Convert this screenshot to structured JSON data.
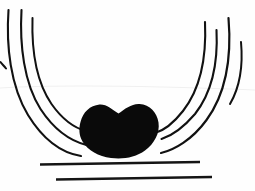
{
  "figure": {
    "canvas": {
      "width": 255,
      "height": 191,
      "background_color": "#fefefe"
    },
    "ink_color": "#111111",
    "mass_color": "#0a0a0a",
    "artifact_color": "#f0f0f0"
  },
  "left_fan": {
    "name": "left-arc-bundle",
    "count": 4,
    "strokes": [
      {
        "id": "left-arc-1",
        "label": "outer left arc",
        "width": 2.1,
        "d": "M 8.5 10 C 6.0 46 10.5 86 28.0 115 C 44.0 141 62.0 153 81.0 156"
      },
      {
        "id": "left-arc-2",
        "label": "second left arc",
        "width": 2.1,
        "d": "M 21.5 10 C 19.5 45 24.0 83 40.5 109 C 55.0 131 70.5 141 86.5 145"
      },
      {
        "id": "left-arc-3",
        "label": "third left arc",
        "width": 2.0,
        "d": "M 32.5 18 C 31.5 50 36.5 82 51.5 104 C 63.5 121 74.5 128 86.0 131"
      },
      {
        "id": "left-arc-4",
        "label": "short left edge tick",
        "width": 2.0,
        "d": "M 0.5 62 C 2.0 64 4.0 66 6.0 68.5"
      }
    ]
  },
  "right_fan": {
    "name": "right-arc-bundle",
    "count": 4,
    "strokes": [
      {
        "id": "right-arc-1",
        "label": "inner right arc",
        "width": 2.1,
        "d": "M 205.0 22 C 206.5 55 201.0 88 183.0 111 C 172.0 125 162.0 131 155.0 133"
      },
      {
        "id": "right-arc-2",
        "label": "second right arc",
        "width": 2.1,
        "d": "M 216.5 30 C 218.0 60 213.0 91 195.0 114 C 183.0 128 171.0 136 161.5 139"
      },
      {
        "id": "right-arc-3",
        "label": "outer right arc",
        "width": 2.2,
        "d": "M 228.5 18 C 231.5 54 227.0 92 206.5 120 C 192.0 140 174.0 150 161.0 153"
      },
      {
        "id": "right-arc-4",
        "label": "far right short arc",
        "width": 2.0,
        "d": "M 241.0 42 C 243.0 64 240.5 86 230.0 104"
      }
    ]
  },
  "central_mass": {
    "name": "central-black-mass",
    "label": "solid ink saddle-shaped mass",
    "bounds": {
      "left": 78,
      "right": 159,
      "top": 104,
      "bottom": 159
    },
    "top_notch": {
      "x": 118,
      "y": 114
    },
    "d": "M 80.5 122 C 83.0 112 90.0 105.5 99.5 104.5 C 106.5 104.0 112.0 109.5 118.5 113.5 C 125.0 109.0 131.5 103.5 139.5 104.0 C 150.0 104.8 157.0 112.5 158.5 122.5 C 160.0 133.0 154.5 143.5 145.0 150.5 C 135.5 157.5 123.0 159.5 111.0 158.0 C 98.5 156.4 88.0 150.5 82.5 141.5 C 78.8 135.2 78.8 128.0 80.5 122 Z"
  },
  "base_rules": {
    "name": "horizontal-base-lines",
    "count": 2,
    "lines": [
      {
        "id": "base-rule-upper",
        "label": "upper horizontal rule",
        "width": 2.3,
        "x1": 40,
        "y1": 164.5,
        "x2": 200,
        "y2": 162.0
      },
      {
        "id": "base-rule-lower",
        "label": "lower horizontal rule",
        "width": 2.3,
        "x1": 56,
        "y1": 179.5,
        "x2": 212,
        "y2": 177.0
      }
    ]
  },
  "artifacts": {
    "name": "scan-artifacts",
    "lines": [
      {
        "id": "faint-scan-line",
        "label": "faint horizontal scan band",
        "d": "M 0 88 C 60 84.5 140 85.5 255 90"
      }
    ]
  }
}
